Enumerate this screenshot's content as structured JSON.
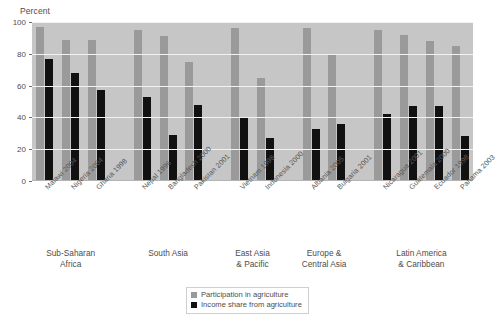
{
  "chart_data": {
    "type": "bar",
    "title": "",
    "ylabel": "Percent",
    "xlabel": "",
    "ylim": [
      0,
      100
    ],
    "yticks": [
      0,
      20,
      40,
      60,
      80,
      100
    ],
    "grid": true,
    "legend_position": "bottom-center",
    "legend": [
      {
        "name": "Participation in agriculture",
        "color": "#9a9a9a"
      },
      {
        "name": "Income share from agriculture",
        "color": "#111111"
      }
    ],
    "categories": [
      "Malawi 2004",
      "Nigeria 2004",
      "Ghana 1998",
      "Nepal 1996",
      "Bangladesh 2000",
      "Pakistan 2001",
      "Vietnam 1998",
      "Indonesia 2000",
      "Albania 2005",
      "Bulgaria 2001",
      "Nicaragua 2001",
      "Guatemala 2000",
      "Ecuador 1998",
      "Panama 2003"
    ],
    "series": [
      {
        "name": "Participation in agriculture",
        "color": "#9a9a9a",
        "values": [
          97,
          89,
          89,
          95,
          91,
          75,
          96,
          65,
          96,
          79,
          95,
          92,
          88,
          85
        ]
      },
      {
        "name": "Income share from agriculture",
        "color": "#111111",
        "values": [
          77,
          68,
          57,
          53,
          29,
          48,
          40,
          27,
          33,
          36,
          42,
          47,
          47,
          28
        ]
      }
    ],
    "groups": [
      {
        "label": "Sub-Saharan\nAfrica",
        "members": [
          "Malawi 2004",
          "Nigeria 2004",
          "Ghana 1998"
        ]
      },
      {
        "label": "South Asia",
        "members": [
          "Nepal 1996",
          "Bangladesh 2000",
          "Pakistan 2001"
        ]
      },
      {
        "label": "East Asia\n& Pacific",
        "members": [
          "Vietnam 1998",
          "Indonesia 2000"
        ]
      },
      {
        "label": "Europe &\nCentral Asia",
        "members": [
          "Albania 2005",
          "Bulgaria 2001"
        ]
      },
      {
        "label": "Latin America\n& Caribbean",
        "members": [
          "Nicaragua 2001",
          "Guatemala 2000",
          "Ecuador 1998",
          "Panama 2003"
        ]
      }
    ]
  },
  "colors": {
    "plot_background": "#c6c6c6",
    "gridline": "#f2f2f2",
    "participation": "#9a9a9a",
    "income": "#111111",
    "text": "#4d4d4d",
    "page_background": "#ffffff"
  }
}
